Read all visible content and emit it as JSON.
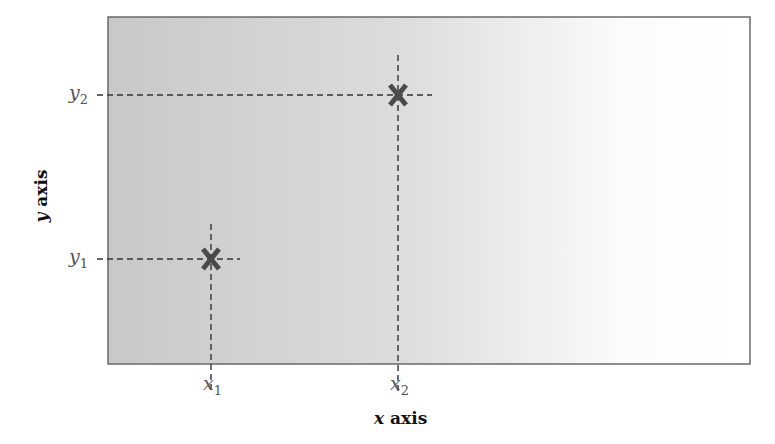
{
  "diagram": {
    "type": "coordinate-plot-schematic",
    "x_axis_label": {
      "var": "x",
      "text": "axis"
    },
    "y_axis_label": {
      "var": "y",
      "text": "axis"
    },
    "points": [
      {
        "name": "point-1",
        "marker": "X",
        "x_label": "x",
        "x_sub": "1",
        "y_label": "y",
        "y_sub": "1"
      },
      {
        "name": "point-2",
        "marker": "X",
        "x_label": "x",
        "x_sub": "2",
        "y_label": "y",
        "y_sub": "2"
      }
    ],
    "colors": {
      "plot_fill_left": "#c9c9c9",
      "plot_fill_right": "#ffffff",
      "frame": "#6a6a6a",
      "marker": "#4a4a4a",
      "guide": "#333333",
      "tick_label": "#555555",
      "axis_title": "#111111"
    }
  }
}
